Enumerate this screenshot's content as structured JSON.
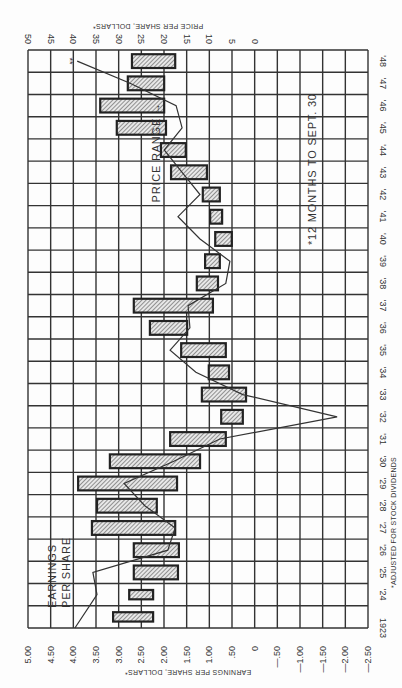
{
  "chart_data": {
    "type": "bar",
    "subtype": "floating-range-bars-with-line",
    "orientation": "rotated 90deg counter-clockwise (years run bottom-to-top on right edge)",
    "title": "",
    "xlabel": "Year",
    "ylabel_left": "Earnings Per Share, Dollars*",
    "ylabel_right": "Price Per Share, Dollars*",
    "earnings_ticks": [
      "5.00",
      "4.50",
      "4.00",
      "3.50",
      "3.00",
      "2.50",
      "2.00",
      "1.50",
      "1.00",
      ".50",
      "0",
      "-.50",
      "-1.00",
      "-1.50",
      "-2.00",
      "-2.50"
    ],
    "price_ticks": [
      "50",
      "45",
      "40",
      "35",
      "30",
      "25",
      "20",
      "15",
      "10",
      "5",
      "0"
    ],
    "earnings_range": [
      -2.5,
      5.0
    ],
    "price_range": [
      0,
      50
    ],
    "categories": [
      "1923",
      "'24",
      "'25",
      "'26",
      "'27",
      "'28",
      "'29",
      "'30",
      "'31",
      "'32",
      "'33",
      "'34",
      "'35",
      "'36",
      "'37",
      "'38",
      "'39",
      "'40",
      "'41",
      "'42",
      "'43",
      "'44",
      "'45",
      "'46",
      "'47",
      "'48"
    ],
    "series": [
      {
        "name": "Price Range",
        "kind": "range-bar",
        "low": [
          22.8,
          22.8,
          17.4,
          17.2,
          18.0,
          22.0,
          17.6,
          12.6,
          7.0,
          3.3,
          2.6,
          6.3,
          7.0,
          15.4,
          9.8,
          8.7,
          8.3,
          5.7,
          7.8,
          8.3,
          11.1,
          15.7,
          20.0,
          20.4,
          20.4,
          18.0
        ],
        "high": [
          31.5,
          28.0,
          27.0,
          27.0,
          36.1,
          35.0,
          39.1,
          32.2,
          19.1,
          8.0,
          12.2,
          10.7,
          16.7,
          23.5,
          27.0,
          13.3,
          11.5,
          9.3,
          10.4,
          12.0,
          18.9,
          21.1,
          30.7,
          34.3,
          28.3,
          27.4
        ]
      },
      {
        "name": "Earnings Per Share",
        "kind": "line",
        "values": [
          3.98,
          3.5,
          3.59,
          1.96,
          1.8,
          2.46,
          2.91,
          1.83,
          0.83,
          -1.72,
          0.33,
          1.35,
          1.91,
          1.48,
          1.52,
          0.7,
          0.61,
          1.26,
          1.74,
          1.26,
          1.65,
          2.04,
          1.65,
          1.78,
          2.78,
          3.93
        ]
      }
    ],
    "annotations": [
      {
        "text": "Earnings Per Share",
        "target": "line",
        "near": "1924-1926"
      },
      {
        "text": "Price Range",
        "target": "bars",
        "near": "1942-1945"
      },
      {
        "text": "*12 Months to Sept. 30",
        "near": "1940-1946"
      },
      {
        "text": "**",
        "near": "1948 line end"
      }
    ],
    "footnote": "*Adjusted for Stock Dividends",
    "grid": true,
    "legend": "none (inline labels)"
  },
  "labels": {
    "earnings_axis": "Earnings Per Share, Dollars*",
    "price_axis": "Price Per Share, Dollars*",
    "earnings_label_line1": "Earnings",
    "earnings_label_line2": "Per Share",
    "price_range_label": "Price Range",
    "months_note": "*12 Months to Sept. 30",
    "double_star": "**",
    "footnote": "*Adjusted for Stock Dividends"
  }
}
